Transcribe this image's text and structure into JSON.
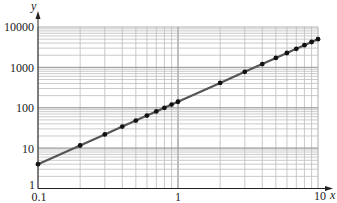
{
  "chart_data": {
    "type": "line",
    "title": "",
    "xlabel": "x",
    "ylabel": "y",
    "x_scale": "log",
    "y_scale": "log",
    "xlim": [
      0.1,
      10
    ],
    "ylim": [
      1,
      10000
    ],
    "grid": true,
    "legend": null,
    "x_tick_labels": [
      "0.1",
      "1",
      "10"
    ],
    "y_tick_labels": [
      "1",
      "10",
      "100",
      "1000",
      "10000"
    ],
    "series": [
      {
        "name": "y vs x",
        "markers": true,
        "x": [
          0.1,
          0.2,
          0.3,
          0.4,
          0.5,
          0.6,
          0.7,
          0.8,
          0.9,
          1,
          2,
          3,
          4,
          5,
          6,
          7,
          8,
          9,
          10
        ],
        "values": [
          4,
          11.6,
          21.8,
          34.1,
          48.2,
          63.9,
          81.1,
          99.8,
          120,
          141,
          413,
          774,
          1210,
          1710,
          2270,
          2880,
          3540,
          4250,
          5000
        ]
      }
    ]
  },
  "colors": {
    "grid_minor": "#bdbdbd",
    "grid_major": "#9a9a9a",
    "axis": "#222222",
    "line": "#555555",
    "marker": "#111111"
  }
}
